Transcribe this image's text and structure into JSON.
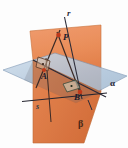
{
  "figure": {
    "kind": "geometry-diagram",
    "background_color": "#fdfdfd"
  },
  "planes": [
    {
      "id": "alpha",
      "label": "α",
      "label_x": 112,
      "label_y": 83,
      "fill": "#b9ccdf",
      "stroke": "#6d89a6",
      "opacity": 0.85,
      "points": "3,70 55,53 127,76 76,103"
    },
    {
      "id": "beta",
      "label": "β",
      "label_x": 80,
      "label_y": 125,
      "fill": "#e8834a",
      "stroke": "#b75a24",
      "opacity": 0.9,
      "points": "30,31 101,25 101,92 84,143 33,143"
    }
  ],
  "lines": [
    {
      "id": "r",
      "label": "r",
      "label_x": 66,
      "label_y": 14,
      "color": "#2f2f3d",
      "x1": 63,
      "y1": 18,
      "x2": 82,
      "y2": 100
    },
    {
      "id": "s",
      "label": "s",
      "label_x": 37,
      "label_y": 106,
      "color": "#2f2f3d",
      "x1": 22,
      "y1": 101,
      "x2": 105,
      "y2": 93
    },
    {
      "id": "PA-segment",
      "label": "",
      "color": "#3a2a28",
      "x1": 57,
      "y1": 34,
      "x2": 40,
      "y2": 78
    },
    {
      "id": "PB-segment",
      "label": "",
      "color": "#3a2a28",
      "x1": 58,
      "y1": 36,
      "x2": 80,
      "y2": 94
    },
    {
      "id": "intersection-edge",
      "label": "",
      "color": "#2f2f3d",
      "x1": 33,
      "y1": 60,
      "x2": 106,
      "y2": 97
    },
    {
      "id": "A-vertical",
      "label": "",
      "color": "#3a2a28",
      "x1": 46,
      "y1": 61,
      "x2": 50,
      "y2": 118
    }
  ],
  "points": [
    {
      "id": "P",
      "label": "P",
      "x": 59,
      "y": 37,
      "label_x": 63,
      "label_y": 36,
      "color": "#c0391b"
    },
    {
      "id": "A",
      "label": "A",
      "x": 44,
      "y": 70,
      "label_x": 43,
      "label_y": 74,
      "color": "#c0391b"
    },
    {
      "id": "B",
      "label": "B",
      "x": 80,
      "y": 92,
      "label_x": 75,
      "label_y": 94,
      "color": "#c0391b"
    }
  ],
  "right_angle_markers": [
    {
      "id": "right-angle-at-A",
      "x": 44,
      "y": 60,
      "size": 11,
      "skew": -10
    },
    {
      "id": "right-angle-at-B",
      "x": 69,
      "y": 84,
      "size": 12,
      "skew": 14
    }
  ],
  "legend": {
    "plane_alpha": "α",
    "plane_beta": "β",
    "line_r": "r",
    "line_s": "s",
    "point_p": "P",
    "point_a": "A",
    "point_b": "B"
  }
}
